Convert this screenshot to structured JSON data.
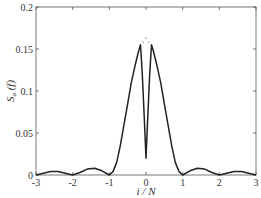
{
  "chart_data": {
    "type": "line",
    "title": "",
    "xlabel": "i / N",
    "ylabel": "S_a (f)",
    "ylabel_main": "S",
    "ylabel_sub": "a",
    "ylabel_arg": " (f)",
    "xlim": [
      -3,
      3
    ],
    "ylim": [
      0,
      0.2
    ],
    "xticks": [
      -3,
      -2,
      -1,
      0,
      1,
      2,
      3
    ],
    "xtick_labels": [
      "-3",
      "-2",
      "-1",
      "0",
      "1",
      "2",
      "3"
    ],
    "yticks": [
      0,
      0.05,
      0.1,
      0.15,
      0.2
    ],
    "ytick_labels": [
      "0",
      "0.05",
      "0.1",
      "0.15",
      "0.2"
    ],
    "grid": false,
    "legend": null,
    "series": [
      {
        "name": "S_a(f)",
        "color": "#222222",
        "x": [
          -3.0,
          -2.8,
          -2.6,
          -2.5,
          -2.4,
          -2.2,
          -2.0,
          -1.8,
          -1.6,
          -1.4,
          -1.2,
          -1.0,
          -0.9,
          -0.8,
          -0.7,
          -0.6,
          -0.5,
          -0.4,
          -0.3,
          -0.2,
          -0.15,
          -0.1,
          -0.05,
          0.0,
          0.05,
          0.1,
          0.15,
          0.2,
          0.3,
          0.4,
          0.5,
          0.6,
          0.7,
          0.8,
          0.9,
          1.0,
          1.2,
          1.4,
          1.6,
          1.8,
          2.0,
          2.2,
          2.4,
          2.5,
          2.6,
          2.8,
          3.0
        ],
        "values": [
          0.0,
          0.002,
          0.004,
          0.004,
          0.004,
          0.002,
          0.0,
          0.003,
          0.007,
          0.008,
          0.005,
          0.0,
          0.004,
          0.015,
          0.035,
          0.06,
          0.085,
          0.11,
          0.13,
          0.148,
          0.155,
          0.12,
          0.07,
          0.02,
          0.07,
          0.12,
          0.155,
          0.148,
          0.13,
          0.11,
          0.085,
          0.06,
          0.035,
          0.015,
          0.004,
          0.0,
          0.005,
          0.008,
          0.007,
          0.003,
          0.0,
          0.002,
          0.004,
          0.004,
          0.004,
          0.002,
          0.0
        ]
      }
    ],
    "annotations": [
      {
        "type": "dots",
        "x": [
          -0.08,
          0.0,
          0.08
        ],
        "y": [
          0.158,
          0.163,
          0.158
        ],
        "note": "small dotted marks above the central notch"
      }
    ]
  }
}
